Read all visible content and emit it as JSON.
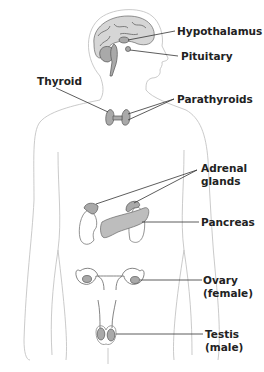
{
  "figure": {
    "labels": {
      "hypothalamus": "Hypothalamus",
      "pituitary": "Pituitary",
      "thyroid": "Thyroid",
      "parathyroids": "Parathyroids",
      "adrenal_line1": "Adrenal",
      "adrenal_line2": "glands",
      "pancreas": "Pancreas",
      "ovary_line1": "Ovary",
      "ovary_line2": "(female)",
      "testis_line1": "Testis",
      "testis_line2": "(male)"
    }
  }
}
